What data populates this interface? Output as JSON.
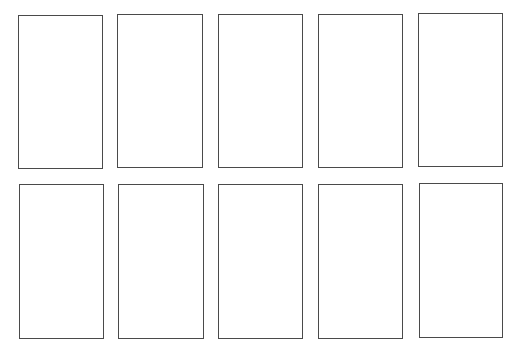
{
  "layout": {
    "rows": 2,
    "columns": 5,
    "border_color": "#4a4a4a",
    "background_color": "#ffffff"
  },
  "cards": [
    {
      "row": 0,
      "col": 0,
      "x": 18,
      "y": 15,
      "w": 85,
      "h": 154,
      "label": ""
    },
    {
      "row": 0,
      "col": 1,
      "x": 117,
      "y": 14,
      "w": 86,
      "h": 154,
      "label": ""
    },
    {
      "row": 0,
      "col": 2,
      "x": 218,
      "y": 14,
      "w": 85,
      "h": 154,
      "label": ""
    },
    {
      "row": 0,
      "col": 3,
      "x": 318,
      "y": 14,
      "w": 85,
      "h": 154,
      "label": ""
    },
    {
      "row": 0,
      "col": 4,
      "x": 418,
      "y": 13,
      "w": 85,
      "h": 154,
      "label": ""
    },
    {
      "row": 1,
      "col": 0,
      "x": 19,
      "y": 184,
      "w": 85,
      "h": 155,
      "label": ""
    },
    {
      "row": 1,
      "col": 1,
      "x": 118,
      "y": 184,
      "w": 86,
      "h": 155,
      "label": ""
    },
    {
      "row": 1,
      "col": 2,
      "x": 218,
      "y": 184,
      "w": 85,
      "h": 155,
      "label": ""
    },
    {
      "row": 1,
      "col": 3,
      "x": 318,
      "y": 184,
      "w": 85,
      "h": 155,
      "label": ""
    },
    {
      "row": 1,
      "col": 4,
      "x": 419,
      "y": 183,
      "w": 84,
      "h": 155,
      "label": ""
    }
  ]
}
